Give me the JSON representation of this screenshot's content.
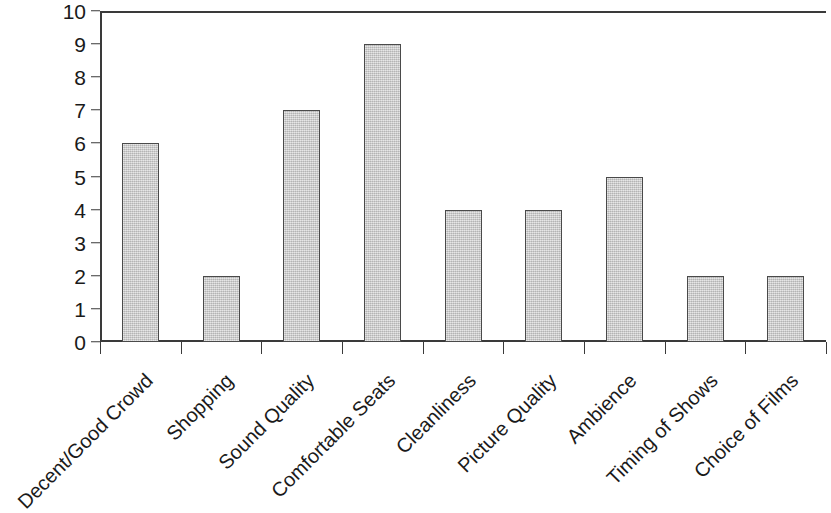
{
  "chart_data": {
    "type": "bar",
    "title": "",
    "xlabel": "",
    "ylabel": "",
    "ylim": [
      0,
      10
    ],
    "yticks": [
      0,
      1,
      2,
      3,
      4,
      5,
      6,
      7,
      8,
      9,
      10
    ],
    "grid": false,
    "legend": false,
    "bar_color": "#c9c9c9",
    "bar_edge_color": "#4a4a4a",
    "axis_color": "#3a3a3a",
    "categories": [
      "Decent/Good Crowd",
      "Shopping",
      "Sound Quality",
      "Comfortable Seats",
      "Cleanliness",
      "Picture Quality",
      "Ambience",
      "Timing of Shows",
      "Choice of Films"
    ],
    "values": [
      6,
      2,
      7,
      9,
      4,
      4,
      5,
      2,
      2
    ]
  }
}
